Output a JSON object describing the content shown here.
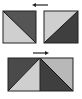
{
  "diagram": {
    "colors": {
      "dark": "#555555",
      "light": "#cfcfcf",
      "border": "#222222",
      "arrow": "#222222",
      "background": "#ffffff"
    },
    "top_row": {
      "arrow_direction": "left",
      "tiles": [
        {
          "name": "left-tile",
          "dark_half": "upper-right",
          "light_half": "lower-left",
          "diagonal": "top-left-to-bottom-right"
        },
        {
          "name": "right-tile",
          "dark_half": "lower-right",
          "light_half": "upper-left",
          "diagonal": "bottom-left-to-top-right"
        }
      ]
    },
    "bottom_row": {
      "arrow_direction": "right",
      "tiles": [
        {
          "name": "left-half",
          "dark_half": "upper-left",
          "light_half": "lower-right",
          "diagonal": "bottom-left-to-top-right"
        },
        {
          "name": "right-half",
          "dark_half": "lower-left",
          "light_half": "upper-right",
          "diagonal": "top-left-to-bottom-right"
        }
      ]
    }
  }
}
